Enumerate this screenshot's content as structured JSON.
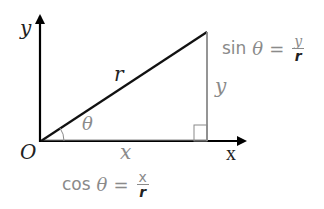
{
  "diagram": {
    "axes": {
      "y_label": "y",
      "x_label": "x",
      "origin_label": "O"
    },
    "triangle": {
      "hypotenuse_label": "r",
      "vertical_leg_label": "y",
      "horizontal_leg_label": "x",
      "angle_label": "θ"
    },
    "formulas": {
      "sin": {
        "func": "sin",
        "angle": "θ",
        "equals": "=",
        "numerator": "y",
        "denominator": "r"
      },
      "cos": {
        "func": "cos",
        "angle": "θ",
        "equals": "=",
        "numerator": "x",
        "denominator": "r"
      }
    },
    "colors": {
      "axis": "#000000",
      "hypotenuse": "#111111",
      "leg_gray": "#8a8a8a",
      "text_gray": "#8a8a8a",
      "text_dark": "#222222"
    }
  }
}
